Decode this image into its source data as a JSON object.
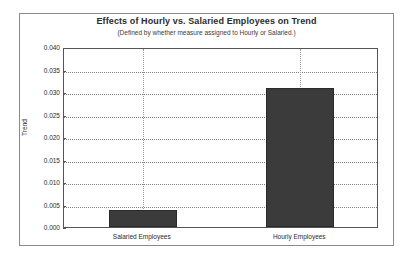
{
  "chart_data": {
    "type": "bar",
    "title": "Effects of Hourly vs. Salaried Employees on Trend",
    "subtitle": "(Defined by whether measure assigned to Hourly or Salaried.)",
    "xlabel": "",
    "ylabel": "Trend",
    "categories": [
      "Salaried Employees",
      "Hourly Employees"
    ],
    "values": [
      0.0037,
      0.031
    ],
    "ylim": [
      0.0,
      0.04
    ],
    "ytick_values": [
      0.0,
      0.005,
      0.01,
      0.015,
      0.02,
      0.025,
      0.03,
      0.035,
      0.04
    ],
    "ytick_labels": [
      "0.000",
      "0.005",
      "0.010",
      "0.015",
      "0.020",
      "0.025",
      "0.030",
      "0.035",
      "0.040"
    ],
    "grid": true,
    "grid_style": "dotted",
    "legend": null,
    "bar_color": "#3b3b3b",
    "bar_edge_color": "#2a2a2a",
    "plot_border_color": "#555555",
    "frame_border_color": "#8a8a8a",
    "background_color": "#ffffff",
    "text_color": "#2b2b2b"
  }
}
